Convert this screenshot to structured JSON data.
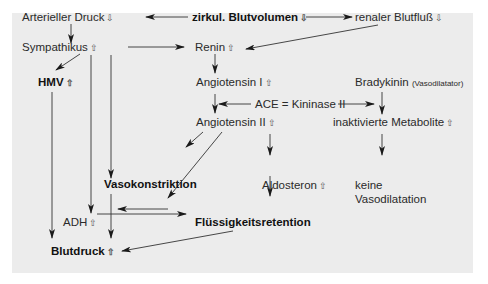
{
  "glyphs": {
    "up": "⇧",
    "down": "⇩"
  },
  "nodes": {
    "arterieller_druck": {
      "label": "Arterieller Druck",
      "arrow": "⇩"
    },
    "blutvolumen": {
      "label": "zirkul. Blutvolumen",
      "arrow": "⇩"
    },
    "renaler_blutfluss": {
      "label": "renaler Blutfluß",
      "arrow": "⇩"
    },
    "sympathikus": {
      "label": "Sympathikus",
      "arrow": "⇧"
    },
    "renin": {
      "label": "Renin",
      "arrow": "⇧"
    },
    "hmv": {
      "label": "HMV",
      "arrow": "⇧"
    },
    "angiotensin1": {
      "label": "Angiotensin I",
      "arrow": "⇧"
    },
    "bradykinin": {
      "label": "Bradykinin",
      "note": "(Vasodilatator)"
    },
    "ace": {
      "label": "ACE = Kininase II"
    },
    "angiotensin2": {
      "label": "Angiotensin II",
      "arrow": "⇧"
    },
    "metabolite": {
      "label": "inaktivierte Metabolite",
      "arrow": "⇧"
    },
    "vasokonstriktion": {
      "label": "Vasokonstriktion"
    },
    "aldosteron": {
      "label": "Aldosteron",
      "arrow": "⇧"
    },
    "keine1": {
      "label": "keine"
    },
    "keine2": {
      "label": "Vasodilatation"
    },
    "adh": {
      "label": "ADH",
      "arrow": "⇧"
    },
    "fluessigkeit": {
      "label": "Flüssigkeitsretention"
    },
    "blutdruck": {
      "label": "Blutdruck",
      "arrow": "⇧"
    }
  }
}
